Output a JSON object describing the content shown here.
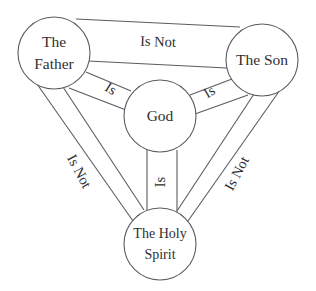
{
  "diagram": {
    "background_color": "#ffffff",
    "line_color": "#5b5b63",
    "text_color": "#2f2f33",
    "nodes": [
      {
        "id": "father",
        "label_line1": "The",
        "label_line2": "Father",
        "cx": 54,
        "cy": 53,
        "r": 36
      },
      {
        "id": "son",
        "label_line1": "The Son",
        "label_line2": "",
        "cx": 262,
        "cy": 60,
        "r": 36
      },
      {
        "id": "god",
        "label_line1": "God",
        "label_line2": "",
        "cx": 160,
        "cy": 116,
        "r": 36
      },
      {
        "id": "holy_spirit",
        "label_line1": "The Holy",
        "label_line2": "Spirit",
        "cx": 160,
        "cy": 244,
        "r": 36
      }
    ],
    "links": [
      {
        "id": "father-son",
        "from": "father",
        "to": "son",
        "label": "Is Not",
        "label_x": 158,
        "label_y": 43,
        "rotation": 2
      },
      {
        "id": "father-god",
        "from": "father",
        "to": "god",
        "label": "Is",
        "label_x": 110,
        "label_y": 90,
        "rotation": 32
      },
      {
        "id": "son-god",
        "from": "son",
        "to": "god",
        "label": "Is",
        "label_x": 210,
        "label_y": 93,
        "rotation": -32
      },
      {
        "id": "god-holy_spirit",
        "from": "god",
        "to": "holy_spirit",
        "label": "Is",
        "label_x": 162,
        "label_y": 182,
        "rotation": -90
      },
      {
        "id": "father-holy_spirit",
        "from": "father",
        "to": "holy_spirit",
        "label": "Is Not",
        "label_x": 78,
        "label_y": 172,
        "rotation": 62
      },
      {
        "id": "son-holy_spirit",
        "from": "son",
        "to": "holy_spirit",
        "label": "Is Not",
        "label_x": 238,
        "label_y": 174,
        "rotation": -62
      }
    ]
  }
}
